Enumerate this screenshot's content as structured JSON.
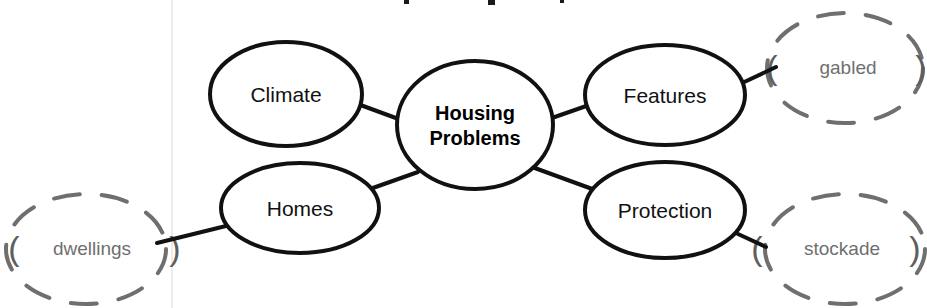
{
  "diagram": {
    "type": "concept-map",
    "center": {
      "id": "center",
      "label_line1": "Housing",
      "label_line2": "Problems",
      "shape": "ellipse",
      "style": "solid",
      "cx": 475,
      "cy": 125,
      "rx": 78,
      "ry": 64
    },
    "nodes": [
      {
        "id": "climate",
        "label": "Climate",
        "shape": "ellipse",
        "style": "solid",
        "cx": 286,
        "cy": 94,
        "rx": 76,
        "ry": 52
      },
      {
        "id": "homes",
        "label": "Homes",
        "shape": "ellipse",
        "style": "solid",
        "cx": 300,
        "cy": 208,
        "rx": 79,
        "ry": 45
      },
      {
        "id": "features",
        "label": "Features",
        "shape": "ellipse",
        "style": "solid",
        "cx": 665,
        "cy": 95,
        "rx": 80,
        "ry": 50
      },
      {
        "id": "protection",
        "label": "Protection",
        "shape": "ellipse",
        "style": "solid",
        "cx": 665,
        "cy": 210,
        "rx": 80,
        "ry": 48
      }
    ],
    "ghost_nodes": [
      {
        "id": "gabled",
        "label": "gabled",
        "shape": "ellipse",
        "style": "dashed",
        "cx": 845,
        "cy": 68,
        "rx": 78,
        "ry": 55,
        "left_paren": "(",
        "right_paren": ")"
      },
      {
        "id": "dwellings",
        "label": "dwellings",
        "shape": "ellipse",
        "style": "dashed",
        "cx": 86,
        "cy": 249,
        "rx": 80,
        "ry": 55,
        "left_paren": "(",
        "right_paren": ")"
      },
      {
        "id": "stockade",
        "label": "stockade",
        "shape": "ellipse",
        "style": "dashed",
        "cx": 845,
        "cy": 249,
        "rx": 80,
        "ry": 55,
        "left_paren": "(",
        "right_paren": ")"
      }
    ],
    "edges": [
      {
        "id": "edge-center-climate",
        "from": "center",
        "to": "climate",
        "x1": 355,
        "y1": 103,
        "x2": 404,
        "y2": 121,
        "style": "solid"
      },
      {
        "id": "edge-center-features",
        "from": "center",
        "to": "features",
        "x1": 549,
        "y1": 119,
        "x2": 592,
        "y2": 104,
        "style": "solid"
      },
      {
        "id": "edge-center-homes",
        "from": "center",
        "to": "homes",
        "x1": 416,
        "y1": 172,
        "x2": 370,
        "y2": 189,
        "style": "solid"
      },
      {
        "id": "edge-center-protection",
        "from": "center",
        "to": "protection",
        "x1": 532,
        "y1": 169,
        "x2": 593,
        "y2": 189,
        "style": "solid"
      },
      {
        "id": "edge-features-gabled",
        "from": "features",
        "to": "gabled",
        "x1": 742,
        "y1": 82,
        "x2": 772,
        "y2": 68,
        "style": "solid"
      },
      {
        "id": "edge-protection-stock",
        "from": "protection",
        "to": "stockade",
        "x1": 741,
        "y1": 237,
        "x2": 765,
        "y2": 246,
        "style": "solid"
      },
      {
        "id": "edge-homes-dwellings",
        "from": "homes",
        "to": "dwellings",
        "x1": 224,
        "y1": 227,
        "x2": 158,
        "y2": 243,
        "style": "solid"
      }
    ],
    "colors": {
      "node_stroke": "#111111",
      "node_fill": "#ffffff",
      "node_text": "#111111",
      "center_text": "#000000",
      "ghost_stroke": "#6f6f6f",
      "ghost_text": "#6f6f6f",
      "paren": "#5e5e5e",
      "edge": "#111111",
      "background": "#ffffff",
      "guide_line": "#e8e8e8"
    },
    "title_fragment": "",
    "guide_line": {
      "x": 172,
      "y1": 0,
      "y2": 308
    }
  }
}
